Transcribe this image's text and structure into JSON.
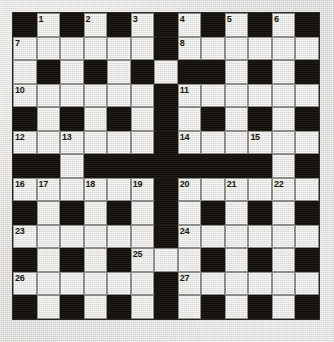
{
  "puzzle": {
    "type": "crossword-grid",
    "rows": 13,
    "cols": 13,
    "colors": {
      "block": "#17140f",
      "open": "#e9e8e4",
      "paper": "#dcdad6",
      "grid_line": "#8d8b87",
      "number_text": "#1a1714"
    },
    "grid": [
      "#.#.#.#.#.#.#",
      "......#......",
      ".#.#.#.##.#.#",
      "......#......",
      "#.#.#.#.#.#.#",
      "......#......",
      "##.########.#",
      "......#......",
      "#.#.#.#.#.#.#",
      "......#......",
      "#.#.#...#.#.#",
      "......#......",
      "#.#.#.#.#.#.#"
    ],
    "numbers": [
      {
        "n": "1",
        "row": 1,
        "col": 2
      },
      {
        "n": "2",
        "row": 1,
        "col": 4
      },
      {
        "n": "3",
        "row": 1,
        "col": 6
      },
      {
        "n": "4",
        "row": 1,
        "col": 8
      },
      {
        "n": "5",
        "row": 1,
        "col": 10
      },
      {
        "n": "6",
        "row": 1,
        "col": 12
      },
      {
        "n": "7",
        "row": 2,
        "col": 1
      },
      {
        "n": "8",
        "row": 2,
        "col": 8
      },
      {
        "n": "9",
        "row": 3,
        "col": 6
      },
      {
        "n": "10",
        "row": 4,
        "col": 1
      },
      {
        "n": "11",
        "row": 4,
        "col": 8
      },
      {
        "n": "12",
        "row": 6,
        "col": 1
      },
      {
        "n": "13",
        "row": 6,
        "col": 3
      },
      {
        "n": "14",
        "row": 6,
        "col": 8
      },
      {
        "n": "15",
        "row": 6,
        "col": 11
      },
      {
        "n": "16",
        "row": 8,
        "col": 1
      },
      {
        "n": "17",
        "row": 8,
        "col": 2
      },
      {
        "n": "18",
        "row": 8,
        "col": 4
      },
      {
        "n": "19",
        "row": 8,
        "col": 6
      },
      {
        "n": "20",
        "row": 8,
        "col": 8
      },
      {
        "n": "21",
        "row": 8,
        "col": 10
      },
      {
        "n": "22",
        "row": 8,
        "col": 12
      },
      {
        "n": "23",
        "row": 10,
        "col": 1
      },
      {
        "n": "24",
        "row": 10,
        "col": 8
      },
      {
        "n": "25",
        "row": 11,
        "col": 6
      },
      {
        "n": "26",
        "row": 12,
        "col": 1
      },
      {
        "n": "27",
        "row": 12,
        "col": 8
      }
    ],
    "entries": []
  }
}
